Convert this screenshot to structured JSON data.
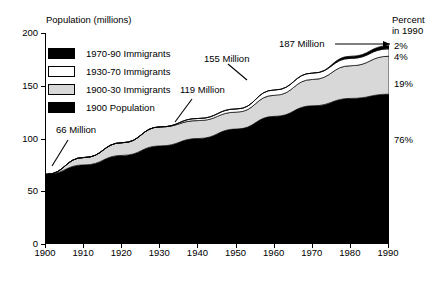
{
  "chart_data": {
    "type": "area",
    "title": "",
    "ylabel": "Population (millions)",
    "xlabel": "",
    "right_axis_label_line1": "Percent",
    "right_axis_label_line2": "in 1990",
    "grid": false,
    "legend_position": "upper-left",
    "xlim": [
      1900,
      1990
    ],
    "ylim": [
      0,
      200
    ],
    "x": [
      1900,
      1910,
      1920,
      1930,
      1940,
      1950,
      1960,
      1970,
      1980,
      1990
    ],
    "xticks": [
      "1900",
      "1910",
      "1920",
      "1930",
      "1940",
      "1950",
      "1960",
      "1970",
      "1980",
      "1990"
    ],
    "yticks": [
      "0",
      "50",
      "100",
      "150",
      "200"
    ],
    "stacked": true,
    "series": [
      {
        "name": "1900 Population",
        "color": "#000000",
        "values": [
          66,
          75,
          84,
          93,
          100,
          109,
          121,
          131,
          138,
          142
        ]
      },
      {
        "name": "1900-30 Immigrants",
        "color": "#d8d8d8",
        "values": [
          0,
          7,
          12,
          18,
          17,
          16,
          20,
          25,
          31,
          36
        ]
      },
      {
        "name": "1930-70 Immigrants",
        "color": "#ffffff",
        "values": [
          0,
          0,
          0,
          0,
          2,
          3,
          5,
          6,
          7,
          7
        ]
      },
      {
        "name": "1970-90 Immigrants",
        "color": "#000000",
        "values": [
          0,
          0,
          0,
          0,
          0,
          0,
          0,
          0,
          2,
          3
        ]
      }
    ],
    "totals": [
      66,
      82,
      96,
      111,
      119,
      128,
      146,
      162,
      178,
      188
    ],
    "annotations": [
      {
        "text": "66 Million",
        "value": 66,
        "year": 1900
      },
      {
        "text": "119 Million",
        "value": 119,
        "year": 1940
      },
      {
        "text": "155 Million",
        "value": 155,
        "year": 1960
      },
      {
        "text": "187 Million",
        "value": 187,
        "year": 1990
      }
    ],
    "right_percentages": [
      {
        "text": "2%",
        "series": "1970-90 Immigrants"
      },
      {
        "text": "4%",
        "series": "1930-70 Immigrants"
      },
      {
        "text": "19%",
        "series": "1900-30 Immigrants"
      },
      {
        "text": "76%",
        "series": "1900 Population"
      }
    ]
  },
  "legend": {
    "items": [
      {
        "label": "1970-90 Immigrants",
        "color": "#000000"
      },
      {
        "label": "1930-70 Immigrants",
        "color": "#ffffff"
      },
      {
        "label": "1900-30 Immigrants",
        "color": "#d8d8d8"
      },
      {
        "label": "1900 Population",
        "color": "#000000"
      }
    ]
  }
}
